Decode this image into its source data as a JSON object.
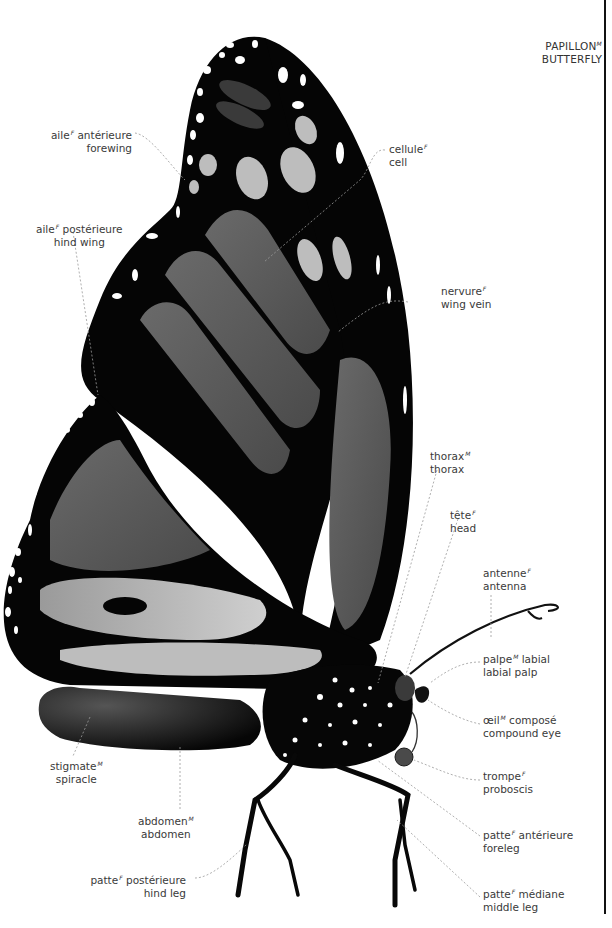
{
  "title": {
    "fr": "PAPILLON",
    "gender": "M",
    "en": "BUTTERFLY"
  },
  "colors": {
    "wing_black": "#050505",
    "wing_panel": "#5a5a5a",
    "wing_panel_light": "#8c8c8c",
    "spot_white": "#ffffff",
    "spot_grey": "#bdbdbd",
    "leader_line": "#9a9a9a",
    "label_text": "#3a3a3a"
  },
  "labels": [
    {
      "id": "forewing",
      "fr": "aile",
      "gender": "F",
      "fr_rest": " antérieure",
      "en": "forewing"
    },
    {
      "id": "hind-wing",
      "fr": "aile",
      "gender": "F",
      "fr_rest": " postérieure",
      "en": "hind wing"
    },
    {
      "id": "cell",
      "fr": "cellule",
      "gender": "F",
      "fr_rest": "",
      "en": "cell"
    },
    {
      "id": "wing-vein",
      "fr": "nervure",
      "gender": "F",
      "fr_rest": "",
      "en": "wing vein"
    },
    {
      "id": "thorax",
      "fr": "thorax",
      "gender": "M",
      "fr_rest": "",
      "en": "thorax"
    },
    {
      "id": "head",
      "fr": "tête",
      "gender": "F",
      "fr_rest": "",
      "en": "head"
    },
    {
      "id": "antenna",
      "fr": "antenne",
      "gender": "F",
      "fr_rest": "",
      "en": "antenna"
    },
    {
      "id": "labial-palp",
      "fr": "palpe",
      "gender": "M",
      "fr_rest": " labial",
      "en": "labial palp"
    },
    {
      "id": "compound-eye",
      "fr": "œil",
      "gender": "M",
      "fr_rest": " composé",
      "en": "compound eye"
    },
    {
      "id": "proboscis",
      "fr": "trompe",
      "gender": "F",
      "fr_rest": "",
      "en": "proboscis"
    },
    {
      "id": "foreleg",
      "fr": "patte",
      "gender": "F",
      "fr_rest": " antérieure",
      "en": "foreleg"
    },
    {
      "id": "middle-leg",
      "fr": "patte",
      "gender": "F",
      "fr_rest": " médiane",
      "en": "middle leg"
    },
    {
      "id": "spiracle",
      "fr": "stigmate",
      "gender": "M",
      "fr_rest": "",
      "en": "spiracle"
    },
    {
      "id": "abdomen",
      "fr": "abdomen",
      "gender": "M",
      "fr_rest": "",
      "en": "abdomen"
    },
    {
      "id": "hind-leg",
      "fr": "patte",
      "gender": "F",
      "fr_rest": " postérieure",
      "en": "hind leg"
    }
  ]
}
